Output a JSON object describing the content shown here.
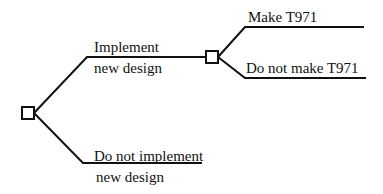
{
  "diagram": {
    "type": "decision-tree",
    "colors": {
      "line": "#111111",
      "background": "#ffffff"
    },
    "root": {
      "node": "decision",
      "branches": [
        {
          "label_line1": "Implement",
          "label_line2": "new design",
          "next": {
            "node": "decision",
            "branches": [
              {
                "label": "Make T971"
              },
              {
                "label": "Do not make T971"
              }
            ]
          }
        },
        {
          "label_line1": "Do not implement",
          "label_line2": "new design"
        }
      ]
    }
  }
}
